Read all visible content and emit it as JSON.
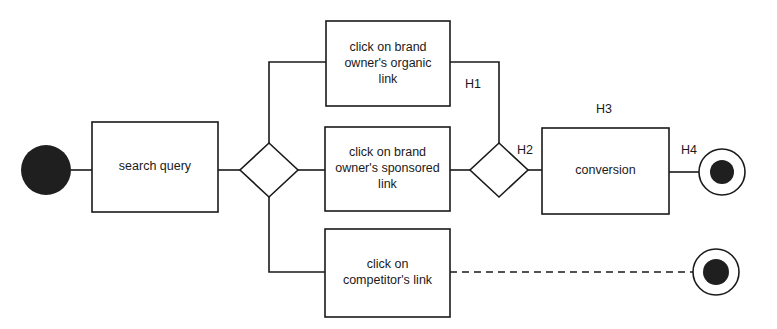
{
  "diagram": {
    "type": "process-flow",
    "title": "",
    "background_color": "#ffffff",
    "line_color": "#1a1a1a",
    "text_color": "#1a1a1a",
    "events": [
      {
        "id": "start-event",
        "kind": "start",
        "style": "filled-circle",
        "label": "",
        "cx": 46,
        "cy": 170,
        "r": 25
      },
      {
        "id": "end-event-conversion",
        "kind": "end",
        "style": "ring-with-filled-center",
        "label": "",
        "cx": 722,
        "cy": 172,
        "r": 23,
        "inner_r": 12
      },
      {
        "id": "end-event-competitor",
        "kind": "end",
        "style": "ring-with-filled-center",
        "label": "",
        "cx": 716,
        "cy": 272,
        "r": 23,
        "inner_r": 13
      }
    ],
    "tasks": [
      {
        "id": "task-search-query",
        "lines": [
          "search query"
        ],
        "x": 92,
        "y": 122,
        "w": 126,
        "h": 90
      },
      {
        "id": "task-organic-link",
        "lines": [
          "click on brand",
          "owner's organic",
          "link"
        ],
        "x": 326,
        "y": 21,
        "w": 124,
        "h": 85
      },
      {
        "id": "task-sponsored-link",
        "lines": [
          "click on brand",
          "owner's sponsored",
          "link"
        ],
        "x": 325,
        "y": 127,
        "w": 125,
        "h": 84
      },
      {
        "id": "task-competitor-link",
        "lines": [
          "click on",
          "competitor's link"
        ],
        "x": 325,
        "y": 229,
        "w": 125,
        "h": 88
      },
      {
        "id": "task-conversion",
        "lines": [
          "conversion"
        ],
        "x": 542,
        "y": 128,
        "w": 127,
        "h": 86
      }
    ],
    "gateways": [
      {
        "id": "gateway-split",
        "cx": 269,
        "cy": 170,
        "rx": 29,
        "ry": 27
      },
      {
        "id": "gateway-merge",
        "cx": 499,
        "cy": 170,
        "rx": 29,
        "ry": 27
      }
    ],
    "edge_labels": [
      {
        "id": "label-h1",
        "text": "H1",
        "x": 473,
        "y": 85
      },
      {
        "id": "label-h2",
        "text": "H2",
        "x": 525,
        "y": 151
      },
      {
        "id": "label-h3",
        "text": "H3",
        "x": 604,
        "y": 110
      },
      {
        "id": "label-h4",
        "text": "H4",
        "x": 689,
        "y": 151
      }
    ],
    "connections": [
      {
        "id": "flow-start-to-search",
        "style": "solid",
        "path": "M 71 170 L 92 170"
      },
      {
        "id": "flow-search-to-gateway",
        "style": "solid",
        "path": "M 218 170 L 240 170"
      },
      {
        "id": "flow-gateway-to-organic",
        "style": "solid",
        "path": "M 269 143 L 269 62 L 326 62"
      },
      {
        "id": "flow-gateway-to-sponsored",
        "style": "solid",
        "path": "M 298 170 L 325 170"
      },
      {
        "id": "flow-gateway-to-competitor",
        "style": "solid",
        "path": "M 269 197 L 269 272 L 325 272"
      },
      {
        "id": "flow-organic-to-merge",
        "style": "solid",
        "path": "M 450 62 L 499 62 L 499 143"
      },
      {
        "id": "flow-sponsored-to-merge",
        "style": "solid",
        "path": "M 450 170 L 470 170"
      },
      {
        "id": "flow-merge-to-conversion",
        "style": "solid",
        "path": "M 528 170 L 542 170"
      },
      {
        "id": "flow-conversion-to-end",
        "style": "solid",
        "path": "M 669 172 L 699 172"
      },
      {
        "id": "flow-competitor-to-end",
        "style": "dashed",
        "path": "M 450 272 L 693 272"
      }
    ]
  }
}
